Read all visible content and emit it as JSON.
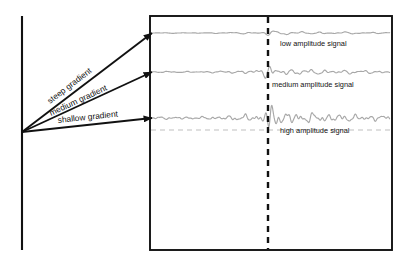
{
  "figure": {
    "title": "",
    "background_color": "#ffffff",
    "axis_line_color": "#111111",
    "box_border_color": "#111111",
    "signal_color": "#a8a8a8",
    "marker_line_color": "#111111",
    "baseline_dash_color": "#c0c0c0",
    "arrow_color": "#111111"
  },
  "axis": {
    "name": "vertical-axis",
    "x": 22,
    "y_top": 16,
    "y_bottom": 250
  },
  "panel": {
    "name": "signal-panel",
    "x": 150,
    "y": 16,
    "width": 242,
    "height": 234
  },
  "marker": {
    "name": "arrival-time-marker",
    "x": 268,
    "style": "dashed",
    "label": ""
  },
  "baseline": {
    "name": "reference-baseline",
    "y": 130,
    "style": "dashed"
  },
  "arrows": [
    {
      "id": "steep",
      "label": "steep gradient",
      "origin": {
        "x": 22,
        "y": 132
      },
      "tip": {
        "x": 152,
        "y": 33
      },
      "label_x": 50,
      "label_y": 104,
      "label_rotation": -37.3
    },
    {
      "id": "medium",
      "label": "medium gradient",
      "origin": {
        "x": 22,
        "y": 132
      },
      "tip": {
        "x": 152,
        "y": 72
      },
      "label_x": 51,
      "label_y": 116,
      "label_rotation": -24.8
    },
    {
      "id": "shallow",
      "label": "shallow gradient",
      "origin": {
        "x": 22,
        "y": 132
      },
      "tip": {
        "x": 152,
        "y": 118
      },
      "label_x": 58,
      "label_y": 123,
      "label_rotation": -6.2
    }
  ],
  "signals": [
    {
      "id": "low",
      "label": "low amplitude signal",
      "baseline_y": 33,
      "amplitude": 1.3,
      "peak_amplitude": 2.2,
      "frequency": 0.55,
      "label_x": 280,
      "label_y": 46
    },
    {
      "id": "medium",
      "label": "medium amplitude signal",
      "baseline_y": 72,
      "amplitude": 2.6,
      "peak_amplitude": 5.5,
      "frequency": 0.72,
      "label_x": 272,
      "label_y": 87
    },
    {
      "id": "high",
      "label": "high amplitude signal",
      "baseline_y": 118,
      "amplitude": 5.0,
      "peak_amplitude": 13.5,
      "frequency": 0.9,
      "label_x": 280,
      "label_y": 133
    }
  ],
  "chart_data": {
    "type": "line",
    "title": "",
    "xlabel": "",
    "ylabel": "",
    "annotations": [
      "steep gradient",
      "medium gradient",
      "shallow gradient",
      "low amplitude signal",
      "medium amplitude signal",
      "high amplitude signal"
    ],
    "series": [
      {
        "name": "low amplitude signal",
        "relative_amplitude": 1,
        "peak_relative_amplitude": 2.2
      },
      {
        "name": "medium amplitude signal",
        "relative_amplitude": 2,
        "peak_relative_amplitude": 5.5
      },
      {
        "name": "high amplitude signal",
        "relative_amplitude": 4,
        "peak_relative_amplitude": 13.5
      }
    ],
    "grid": false,
    "legend": "inline-right"
  }
}
